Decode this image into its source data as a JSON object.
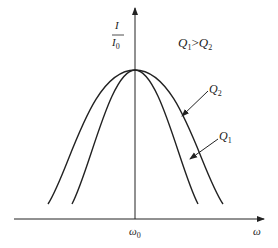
{
  "diagram": {
    "y_axis_label_num": "I",
    "y_axis_label_den": "I",
    "y_axis_label_den_sub": "0",
    "x_axis_label": "ω",
    "center_label": "ω",
    "center_label_sub": "0",
    "relation_q1": "Q",
    "relation_q1_sub": "1",
    "relation_op": ">",
    "relation_q2": "Q",
    "relation_q2_sub": "2",
    "curve_labels": [
      {
        "text": "Q",
        "sub": "2",
        "desc": "wider curve"
      },
      {
        "text": "Q",
        "sub": "1",
        "desc": "narrower curve"
      }
    ],
    "colors": {
      "line": "#222222",
      "background": "#ffffff"
    }
  }
}
